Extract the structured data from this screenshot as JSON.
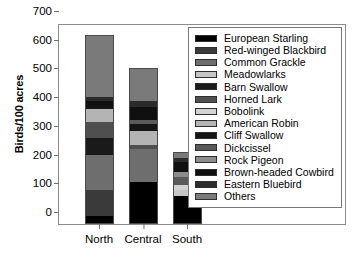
{
  "chart_data": {
    "type": "bar",
    "stacked": true,
    "title": "",
    "xlabel": "",
    "ylabel": "Birds/100 acres",
    "ylim": [
      0,
      700
    ],
    "yticks": [
      0,
      100,
      200,
      300,
      400,
      500,
      600,
      700
    ],
    "grid": false,
    "legend_position": "right-inside",
    "categories": [
      "North",
      "Central",
      "South"
    ],
    "series": [
      {
        "name": "European Starling",
        "color": "#000000",
        "values": [
          25,
          145,
          95
        ]
      },
      {
        "name": "Red-winged Blackbird",
        "color": "#3a3a3a",
        "values": [
          90,
          0,
          0
        ]
      },
      {
        "name": "Common Grackle",
        "color": "#6e6e6e",
        "values": [
          125,
          115,
          0
        ]
      },
      {
        "name": "Meadowlarks",
        "color": "#c6c6c6",
        "values": [
          0,
          0,
          22
        ]
      },
      {
        "name": "Barn Swallow",
        "color": "#1a1a1a",
        "values": [
          60,
          0,
          0
        ]
      },
      {
        "name": "Horned Lark",
        "color": "#4f4f4f",
        "values": [
          55,
          14,
          0
        ]
      },
      {
        "name": "Bobolink",
        "color": "#d2d2d2",
        "values": [
          0,
          0,
          20
        ]
      },
      {
        "name": "American Robin",
        "color": "#b4b4b4",
        "values": [
          45,
          52,
          0
        ]
      },
      {
        "name": "Cliff Swallow",
        "color": "#151515",
        "values": [
          12,
          22,
          0
        ]
      },
      {
        "name": "Dickcissel",
        "color": "#5a5a5a",
        "values": [
          0,
          14,
          28
        ]
      },
      {
        "name": "Rock Pigeon",
        "color": "#8c8c8c",
        "values": [
          0,
          0,
          18
        ]
      },
      {
        "name": "Brown-headed Cowbird",
        "color": "#101010",
        "values": [
          18,
          48,
          35
        ]
      },
      {
        "name": "Eastern Bluebird",
        "color": "#2b2b2b",
        "values": [
          12,
          20,
          14
        ]
      },
      {
        "name": "Others",
        "color": "#7a7a7a",
        "values": [
          218,
          115,
          18
        ]
      }
    ],
    "totals": [
      660,
      545,
      250
    ]
  },
  "legend": {
    "items": [
      "European Starling",
      "Red-winged Blackbird",
      "Common Grackle",
      "Meadowlarks",
      "Barn Swallow",
      "Horned Lark",
      "Bobolink",
      "American Robin",
      "Cliff Swallow",
      "Dickcissel",
      "Rock Pigeon",
      "Brown-headed Cowbird",
      "Eastern Bluebird",
      "Others"
    ],
    "swatch_colors": [
      "#000000",
      "#3a3a3a",
      "#6e6e6e",
      "#c6c6c6",
      "#1a1a1a",
      "#4f4f4f",
      "#d2d2d2",
      "#b4b4b4",
      "#151515",
      "#5a5a5a",
      "#8c8c8c",
      "#101010",
      "#2b2b2b",
      "#7a7a7a"
    ]
  }
}
